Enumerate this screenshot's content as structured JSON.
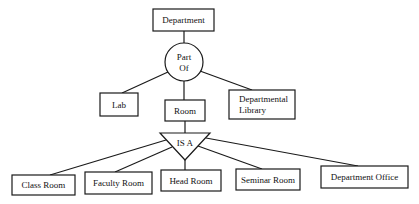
{
  "diagram": {
    "type": "er-hierarchy",
    "root": {
      "label": "Department"
    },
    "relationship": {
      "label_line1": "Part",
      "label_line2": "Of"
    },
    "parts": [
      {
        "label": "Lab"
      },
      {
        "label": "Room"
      },
      {
        "label_line1": "Departmental",
        "label_line2": "Library"
      }
    ],
    "isa": {
      "label": "IS A"
    },
    "subtypes": [
      {
        "label": "Class Room"
      },
      {
        "label": "Faculty Room"
      },
      {
        "label": "Head Room"
      },
      {
        "label": "Seminar Room"
      },
      {
        "label": "Department Office"
      }
    ]
  }
}
